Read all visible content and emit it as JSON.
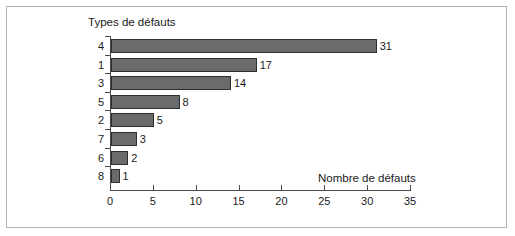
{
  "figure": {
    "background_color": "#ffffff",
    "frame_color": "#b4b4b4",
    "axis_color": "#4a4a4a",
    "bar_fill_color": "#6b6b6b",
    "bar_border_color": "#2e2e2e",
    "text_color": "#1a1a1a"
  },
  "chart_data": {
    "type": "bar",
    "orientation": "horizontal",
    "title": "",
    "xlabel": "Nombre de défauts",
    "ylabel": "Types de défauts",
    "categories": [
      "4",
      "1",
      "3",
      "5",
      "2",
      "7",
      "6",
      "8"
    ],
    "values": [
      31,
      17,
      14,
      8,
      5,
      3,
      2,
      1
    ],
    "data_labels": [
      "31",
      "17",
      "14",
      "8",
      "5",
      "3",
      "2",
      "1"
    ],
    "xlim": [
      0,
      35
    ],
    "xticks": [
      0,
      5,
      10,
      15,
      20,
      25,
      30,
      35
    ],
    "xtick_labels": [
      "0",
      "5",
      "10",
      "15",
      "20",
      "25",
      "30",
      "35"
    ],
    "grid": false,
    "legend": false,
    "legend_position": "none",
    "sorted": "descending"
  }
}
